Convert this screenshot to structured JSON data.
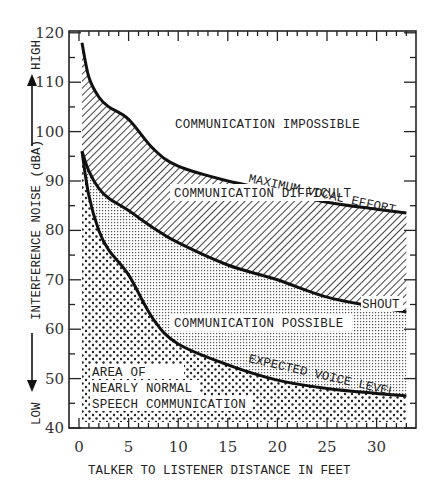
{
  "chart_data": {
    "type": "area",
    "title": "",
    "xlabel": "TALKER TO LISTENER DISTANCE IN FEET",
    "ylabel": "INTERFERENCE NOISE (dBA)",
    "ylabel_high": "HIGH",
    "ylabel_low": "LOW",
    "xlim": [
      0,
      34
    ],
    "ylim": [
      40,
      120
    ],
    "x_ticks": [
      0,
      5,
      10,
      15,
      20,
      25,
      30
    ],
    "y_ticks": [
      40,
      50,
      60,
      70,
      80,
      90,
      100,
      110,
      120
    ],
    "grid": false,
    "series": [
      {
        "name": "MAXIMUM VOCAL EFFORT",
        "x": [
          0.3,
          1,
          2,
          3,
          5,
          7.5,
          10,
          15,
          20,
          25,
          30,
          33
        ],
        "values": [
          118,
          111,
          107,
          105,
          102.5,
          96.5,
          93,
          90,
          88,
          85.7,
          84.3,
          83.5
        ]
      },
      {
        "name": "SHOUT",
        "x": [
          0.3,
          1,
          2,
          3,
          5,
          7.5,
          10,
          15,
          20,
          25,
          30,
          33
        ],
        "values": [
          96,
          92,
          88.5,
          86.5,
          84,
          80.5,
          77.5,
          73,
          70,
          66.5,
          64.5,
          63.5
        ]
      },
      {
        "name": "EXPECTED VOICE LEVEL",
        "x": [
          0.3,
          1,
          2,
          3,
          5,
          7.5,
          10,
          15,
          20,
          25,
          30,
          33
        ],
        "values": [
          96,
          87,
          80,
          76,
          71,
          62,
          57,
          52.8,
          49.7,
          48,
          47,
          46.5
        ]
      }
    ],
    "regions": [
      {
        "label": "COMMUNICATION IMPOSSIBLE",
        "fill": "white"
      },
      {
        "label": "COMMUNICATION DIFFICULT",
        "fill": "diagonal-hatch"
      },
      {
        "label": "COMMUNICATION POSSIBLE",
        "fill": "fine-dots"
      },
      {
        "label_lines": [
          "AREA OF",
          "NEARLY NORMAL",
          "SPEECH COMMUNICATION"
        ],
        "fill": "coarse-dots"
      }
    ]
  },
  "labels": {
    "region_impossible": "COMMUNICATION IMPOSSIBLE",
    "region_difficult": "COMMUNICATION DIFFICULT",
    "region_possible": "COMMUNICATION POSSIBLE",
    "region_normal_1": "AREA OF",
    "region_normal_2": "NEARLY NORMAL",
    "region_normal_3": "SPEECH COMMUNICATION",
    "curve_max": "MAXIMUM VOCAL EFFORT",
    "curve_shout": "SHOUT",
    "curve_expected": "EXPECTED VOICE LEVEL",
    "xlabel": "TALKER TO LISTENER DISTANCE IN FEET",
    "ylabel": "INTERFERENCE NOISE (dBA)",
    "ylabel_high": "HIGH",
    "ylabel_low": "LOW"
  },
  "colors": {
    "ink": "#111111",
    "background": "#ffffff"
  }
}
